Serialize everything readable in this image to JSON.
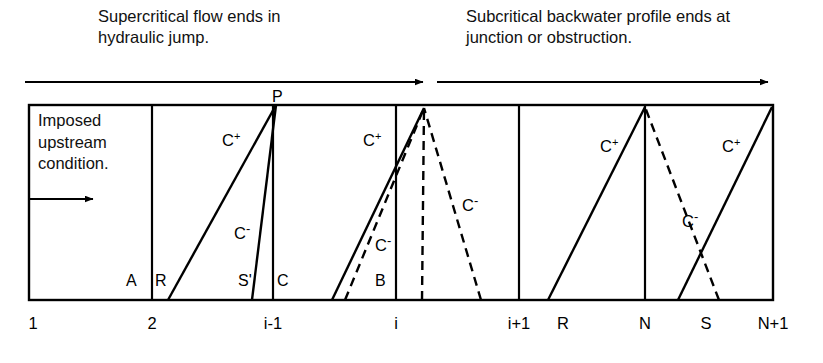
{
  "captions": {
    "left": "Supercritical flow ends in\nhydraulic jump.",
    "right": "Subcritical backwater profile ends at\njunction or obstruction."
  },
  "box": {
    "imposed_note": "Imposed\nupstream\ncondition."
  },
  "axis_labels": [
    {
      "text": "1",
      "x": 33
    },
    {
      "text": "2",
      "x": 152
    },
    {
      "text": "i-1",
      "x": 273
    },
    {
      "text": "i",
      "x": 396
    },
    {
      "text": "i+1",
      "x": 519
    },
    {
      "text": "R",
      "x": 563
    },
    {
      "text": "N",
      "x": 645
    },
    {
      "text": "S",
      "x": 706
    },
    {
      "text": "N+1",
      "x": 773
    }
  ],
  "point_labels": [
    {
      "name": "P",
      "text": "P",
      "x": 272,
      "y": 88
    },
    {
      "name": "A",
      "text": "A",
      "x": 126,
      "y": 272
    },
    {
      "name": "R",
      "text": "R",
      "x": 155,
      "y": 272
    },
    {
      "name": "S-prime",
      "text": "S'",
      "x": 238,
      "y": 272
    },
    {
      "name": "C",
      "text": "C",
      "x": 277,
      "y": 272
    },
    {
      "name": "B",
      "text": "B",
      "x": 375,
      "y": 272
    }
  ],
  "characteristic_labels": [
    {
      "name": "c-plus-1",
      "kind": "plus",
      "x": 222,
      "y": 131
    },
    {
      "name": "c-minus-1",
      "kind": "minus",
      "x": 234,
      "y": 224
    },
    {
      "name": "c-plus-2",
      "kind": "plus",
      "x": 363,
      "y": 131
    },
    {
      "name": "c-minus-2",
      "kind": "minus",
      "x": 375,
      "y": 236
    },
    {
      "name": "c-minus-3",
      "kind": "minus",
      "x": 462,
      "y": 196
    },
    {
      "name": "c-plus-3",
      "kind": "plus",
      "x": 600,
      "y": 137
    },
    {
      "name": "c-minus-4",
      "kind": "minus",
      "x": 682,
      "y": 212
    },
    {
      "name": "c-plus-4",
      "kind": "plus",
      "x": 722,
      "y": 137
    }
  ],
  "characteristic_glyphs": {
    "base": "C",
    "plus_sup": "+",
    "minus_sup": "-"
  },
  "colors": {
    "line": "#000000",
    "background": "#ffffff"
  },
  "geometry": {
    "box": {
      "x1": 29,
      "y1": 105,
      "x2": 773,
      "y2": 300
    },
    "verticals": [
      152,
      273,
      396,
      519,
      645
    ],
    "top_arrows": [
      {
        "name": "supercritical-arrow",
        "x1": 25,
        "x2": 423,
        "y": 82
      },
      {
        "name": "subcritical-arrow",
        "x1": 437,
        "x2": 768,
        "y": 82
      }
    ],
    "inner_arrow": {
      "x1": 29,
      "x2": 93,
      "y": 199
    },
    "solid_lines": [
      {
        "name": "c-plus-seg-1",
        "x1": 168,
        "y1": 300,
        "x2": 276,
        "y2": 105
      },
      {
        "name": "c-minus-seg-1",
        "x1": 252,
        "y1": 300,
        "x2": 276,
        "y2": 105
      },
      {
        "name": "c-plus-seg-2",
        "x1": 332,
        "y1": 300,
        "x2": 424,
        "y2": 108
      },
      {
        "name": "c-plus-seg-3",
        "x1": 548,
        "y1": 300,
        "x2": 645,
        "y2": 107
      },
      {
        "name": "c-plus-seg-4",
        "x1": 678,
        "y1": 300,
        "x2": 772,
        "y2": 107
      }
    ],
    "dashed_lines": [
      {
        "name": "c-minus-dash-1",
        "x1": 345,
        "y1": 300,
        "x2": 424,
        "y2": 108
      },
      {
        "name": "c-minus-dash-2",
        "x1": 422,
        "y1": 300,
        "x2": 424,
        "y2": 108
      },
      {
        "name": "c-minus-dash-3",
        "x1": 481,
        "y1": 300,
        "x2": 424,
        "y2": 108
      },
      {
        "name": "c-minus-dash-4",
        "x1": 719,
        "y1": 300,
        "x2": 645,
        "y2": 107
      }
    ]
  }
}
